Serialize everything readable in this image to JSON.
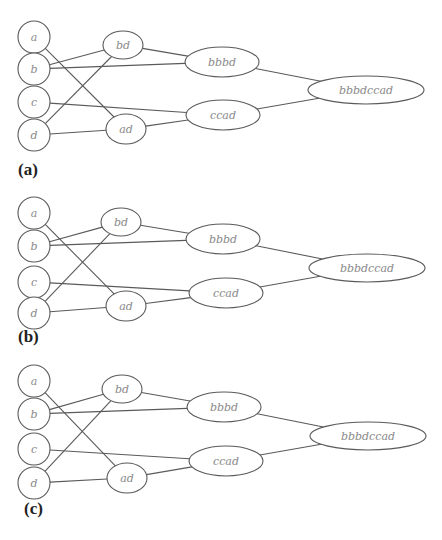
{
  "colors": {
    "stroke": "#5a5a5a",
    "node_text": "#8a8a8a",
    "panel_label": "#222222",
    "background": "#ffffff"
  },
  "edges": [
    [
      "a",
      "ad"
    ],
    [
      "b",
      "bd"
    ],
    [
      "b",
      "bbbd"
    ],
    [
      "c",
      "ccad"
    ],
    [
      "d",
      "bd"
    ],
    [
      "d",
      "ad"
    ],
    [
      "bd",
      "bbbd"
    ],
    [
      "ad",
      "ccad"
    ],
    [
      "bbbd",
      "bbbdccad"
    ],
    [
      "ccad",
      "bbbdccad"
    ]
  ],
  "panels": [
    {
      "label": "(a)",
      "label_pos": [
        18,
        175
      ],
      "nodes": {
        "a": {
          "text": "a",
          "cx": 34,
          "cy": 37,
          "rx": 16,
          "ry": 16
        },
        "b": {
          "text": "b",
          "cx": 34,
          "cy": 69,
          "rx": 16,
          "ry": 16
        },
        "c": {
          "text": "c",
          "cx": 34,
          "cy": 102,
          "rx": 16,
          "ry": 16
        },
        "d": {
          "text": "d",
          "cx": 34,
          "cy": 135,
          "rx": 16,
          "ry": 16
        },
        "bd": {
          "text": "bd",
          "cx": 123,
          "cy": 45,
          "rx": 20,
          "ry": 14
        },
        "ad": {
          "text": "ad",
          "cx": 126,
          "cy": 129,
          "rx": 20,
          "ry": 15
        },
        "bbbd": {
          "text": "bbbd",
          "cx": 222,
          "cy": 62,
          "rx": 37,
          "ry": 15
        },
        "ccad": {
          "text": "ccad",
          "cx": 223,
          "cy": 115,
          "rx": 37,
          "ry": 15
        },
        "bbbdccad": {
          "text": "bbbdccad",
          "cx": 366,
          "cy": 90,
          "rx": 58,
          "ry": 14
        }
      }
    },
    {
      "label": "(b)",
      "label_pos": [
        18,
        342
      ],
      "nodes": {
        "a": {
          "text": "a",
          "cx": 34,
          "cy": 213,
          "rx": 16,
          "ry": 16
        },
        "b": {
          "text": "b",
          "cx": 34,
          "cy": 246,
          "rx": 16,
          "ry": 16
        },
        "c": {
          "text": "c",
          "cx": 34,
          "cy": 282,
          "rx": 16,
          "ry": 16
        },
        "d": {
          "text": "d",
          "cx": 34,
          "cy": 313,
          "rx": 16,
          "ry": 16
        },
        "bd": {
          "text": "bd",
          "cx": 121,
          "cy": 222,
          "rx": 20,
          "ry": 14
        },
        "ad": {
          "text": "ad",
          "cx": 126,
          "cy": 306,
          "rx": 20,
          "ry": 15
        },
        "bbbd": {
          "text": "bbbd",
          "cx": 223,
          "cy": 239,
          "rx": 37,
          "ry": 15
        },
        "ccad": {
          "text": "ccad",
          "cx": 226,
          "cy": 293,
          "rx": 37,
          "ry": 15
        },
        "bbbdccad": {
          "text": "bbbdccad",
          "cx": 367,
          "cy": 268,
          "rx": 58,
          "ry": 14
        }
      }
    },
    {
      "label": "(c)",
      "label_pos": [
        24,
        514
      ],
      "nodes": {
        "a": {
          "text": "a",
          "cx": 34,
          "cy": 381,
          "rx": 16,
          "ry": 16
        },
        "b": {
          "text": "b",
          "cx": 34,
          "cy": 414,
          "rx": 16,
          "ry": 16
        },
        "c": {
          "text": "c",
          "cx": 34,
          "cy": 449,
          "rx": 16,
          "ry": 16
        },
        "d": {
          "text": "d",
          "cx": 34,
          "cy": 483,
          "rx": 16,
          "ry": 16
        },
        "bd": {
          "text": "bd",
          "cx": 122,
          "cy": 389,
          "rx": 20,
          "ry": 14
        },
        "ad": {
          "text": "ad",
          "cx": 127,
          "cy": 478,
          "rx": 20,
          "ry": 15
        },
        "bbbd": {
          "text": "bbbd",
          "cx": 224,
          "cy": 407,
          "rx": 37,
          "ry": 15
        },
        "ccad": {
          "text": "ccad",
          "cx": 226,
          "cy": 461,
          "rx": 37,
          "ry": 15
        },
        "bbbdccad": {
          "text": "bbbdccad",
          "cx": 368,
          "cy": 436,
          "rx": 58,
          "ry": 14
        }
      }
    }
  ]
}
